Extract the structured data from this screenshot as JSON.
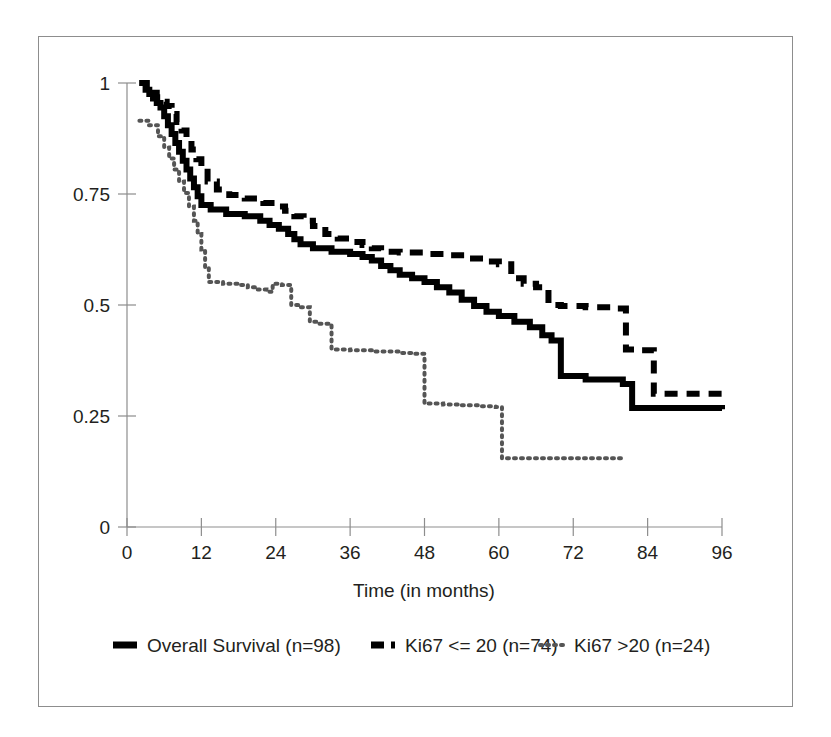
{
  "figure": {
    "background_color": "#ffffff",
    "frame_color": "#8d8d8d",
    "axis_color": "#8d8d8d",
    "text_color": "#231f20"
  },
  "chart_data": {
    "type": "line",
    "subtype": "kaplan-meier-step",
    "title": "",
    "xlabel": "Time (in months)",
    "ylabel": "",
    "xlim": [
      0,
      96
    ],
    "ylim": [
      0,
      1
    ],
    "xticks": [
      0,
      12,
      24,
      36,
      48,
      60,
      72,
      84,
      96
    ],
    "xtick_labels": [
      "0",
      "12",
      "24",
      "36",
      "48",
      "60",
      "72",
      "84",
      "96"
    ],
    "yticks": [
      0,
      0.25,
      0.5,
      0.75,
      1
    ],
    "ytick_labels": [
      "0",
      "0.25",
      "0.5",
      "0.75",
      "1"
    ],
    "grid": false,
    "legend_position": "below",
    "series": [
      {
        "name": "Overall Survival (n=98)",
        "n": 98,
        "style": "solid",
        "color": "#000000",
        "line_width": 6,
        "legend_marker": "solid-bar",
        "points": [
          [
            2.0,
            1.0
          ],
          [
            3.0,
            0.985
          ],
          [
            3.6,
            0.975
          ],
          [
            4.2,
            0.965
          ],
          [
            4.8,
            0.955
          ],
          [
            5.4,
            0.945
          ],
          [
            6.0,
            0.925
          ],
          [
            6.6,
            0.905
          ],
          [
            7.2,
            0.885
          ],
          [
            7.8,
            0.865
          ],
          [
            8.4,
            0.845
          ],
          [
            9.0,
            0.825
          ],
          [
            9.6,
            0.805
          ],
          [
            10.2,
            0.785
          ],
          [
            10.8,
            0.765
          ],
          [
            11.4,
            0.745
          ],
          [
            12.0,
            0.725
          ],
          [
            13.5,
            0.715
          ],
          [
            16.0,
            0.705
          ],
          [
            19.0,
            0.7
          ],
          [
            21.5,
            0.69
          ],
          [
            23.0,
            0.68
          ],
          [
            24.5,
            0.672
          ],
          [
            26.0,
            0.66
          ],
          [
            27.0,
            0.648
          ],
          [
            28.0,
            0.637
          ],
          [
            30.0,
            0.628
          ],
          [
            33.0,
            0.62
          ],
          [
            36.0,
            0.615
          ],
          [
            38.0,
            0.608
          ],
          [
            39.5,
            0.6
          ],
          [
            41.0,
            0.588
          ],
          [
            42.5,
            0.578
          ],
          [
            44.0,
            0.568
          ],
          [
            46.0,
            0.56
          ],
          [
            48.0,
            0.552
          ],
          [
            50.0,
            0.54
          ],
          [
            52.0,
            0.528
          ],
          [
            54.0,
            0.512
          ],
          [
            56.0,
            0.498
          ],
          [
            58.0,
            0.485
          ],
          [
            60.0,
            0.475
          ],
          [
            62.5,
            0.462
          ],
          [
            65.0,
            0.45
          ],
          [
            67.0,
            0.432
          ],
          [
            68.5,
            0.42
          ],
          [
            70.0,
            0.34
          ],
          [
            74.0,
            0.332
          ],
          [
            80.0,
            0.322
          ],
          [
            81.5,
            0.268
          ],
          [
            96.0,
            0.265
          ]
        ]
      },
      {
        "name": "Ki67 <= 20 (n=74)",
        "n": 74,
        "style": "dashed",
        "color": "#000000",
        "line_width": 6,
        "legend_marker": "dashed-bar",
        "points": [
          [
            2.0,
            1.0
          ],
          [
            3.2,
            0.988
          ],
          [
            4.0,
            0.978
          ],
          [
            4.8,
            0.968
          ],
          [
            5.6,
            0.958
          ],
          [
            6.4,
            0.948
          ],
          [
            7.2,
            0.93
          ],
          [
            8.0,
            0.912
          ],
          [
            8.8,
            0.893
          ],
          [
            9.6,
            0.872
          ],
          [
            10.4,
            0.85
          ],
          [
            11.2,
            0.828
          ],
          [
            12.0,
            0.8
          ],
          [
            13.0,
            0.778
          ],
          [
            14.5,
            0.76
          ],
          [
            16.5,
            0.748
          ],
          [
            19.0,
            0.74
          ],
          [
            22.0,
            0.73
          ],
          [
            24.0,
            0.722
          ],
          [
            25.5,
            0.712
          ],
          [
            27.0,
            0.7
          ],
          [
            28.5,
            0.69
          ],
          [
            30.0,
            0.678
          ],
          [
            32.0,
            0.66
          ],
          [
            34.0,
            0.65
          ],
          [
            36.0,
            0.642
          ],
          [
            38.0,
            0.635
          ],
          [
            39.5,
            0.628
          ],
          [
            41.0,
            0.62
          ],
          [
            44.0,
            0.618
          ],
          [
            48.0,
            0.615
          ],
          [
            52.0,
            0.612
          ],
          [
            55.0,
            0.605
          ],
          [
            58.0,
            0.598
          ],
          [
            60.0,
            0.592
          ],
          [
            62.0,
            0.56
          ],
          [
            64.0,
            0.548
          ],
          [
            66.0,
            0.54
          ],
          [
            68.0,
            0.5
          ],
          [
            70.0,
            0.498
          ],
          [
            74.0,
            0.495
          ],
          [
            78.0,
            0.492
          ],
          [
            80.5,
            0.4
          ],
          [
            83.0,
            0.398
          ],
          [
            85.0,
            0.3
          ],
          [
            96.0,
            0.298
          ]
        ]
      },
      {
        "name": "Ki67 >20 (n=24)",
        "n": 24,
        "style": "dotted",
        "color": "#555555",
        "line_width": 4,
        "legend_marker": "dotted-bar",
        "points": [
          [
            2.0,
            0.915
          ],
          [
            3.5,
            0.905
          ],
          [
            5.0,
            0.88
          ],
          [
            6.0,
            0.855
          ],
          [
            6.8,
            0.83
          ],
          [
            7.6,
            0.805
          ],
          [
            8.4,
            0.778
          ],
          [
            9.2,
            0.752
          ],
          [
            10.0,
            0.722
          ],
          [
            10.8,
            0.69
          ],
          [
            11.4,
            0.66
          ],
          [
            12.0,
            0.625
          ],
          [
            12.6,
            0.585
          ],
          [
            13.2,
            0.552
          ],
          [
            15.5,
            0.548
          ],
          [
            18.0,
            0.545
          ],
          [
            19.5,
            0.54
          ],
          [
            21.0,
            0.535
          ],
          [
            22.5,
            0.53
          ],
          [
            23.5,
            0.548
          ],
          [
            25.0,
            0.545
          ],
          [
            26.5,
            0.5
          ],
          [
            28.0,
            0.495
          ],
          [
            29.5,
            0.462
          ],
          [
            31.0,
            0.458
          ],
          [
            33.0,
            0.4
          ],
          [
            36.0,
            0.398
          ],
          [
            40.0,
            0.395
          ],
          [
            44.0,
            0.392
          ],
          [
            46.5,
            0.39
          ],
          [
            48.0,
            0.278
          ],
          [
            51.0,
            0.276
          ],
          [
            54.0,
            0.274
          ],
          [
            57.0,
            0.272
          ],
          [
            59.5,
            0.27
          ],
          [
            60.5,
            0.155
          ],
          [
            70.0,
            0.155
          ],
          [
            80.0,
            0.155
          ]
        ]
      }
    ]
  },
  "legend": {
    "items": [
      {
        "label": "Overall Survival (n=98)",
        "marker": "solid-bar"
      },
      {
        "label": "Ki67 <= 20 (n=74)",
        "marker": "dashed-bar"
      },
      {
        "label": "Ki67 >20 (n=24)",
        "marker": "dotted-bar"
      }
    ]
  }
}
